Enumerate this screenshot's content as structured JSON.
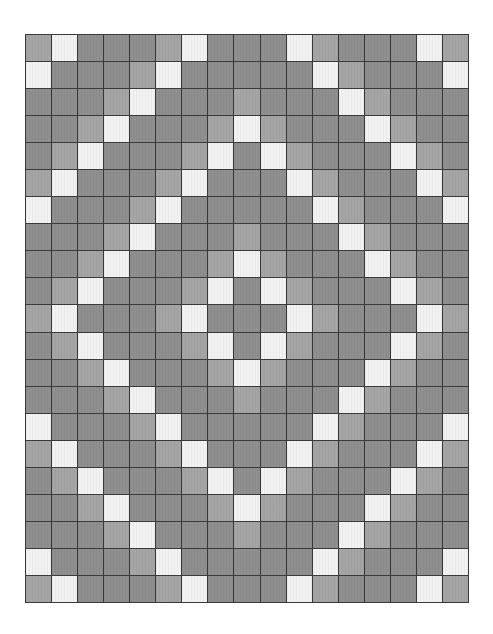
{
  "pattern": {
    "columns": 17,
    "rows": 21,
    "palette": {
      "W": "#f2f2f2",
      "L": "#a5a5a5",
      "M": "#8f8f8f"
    },
    "grid_line_color": "#3a3a3a",
    "cells": [
      "LWMMMLWMMMWLMMMWL",
      "WMMMLWMMMMMWLMMMW",
      "MMMLWMMMLMMMWLMMM",
      "MMLWMMMLWLMMMWLMM",
      "MLWMMMLWMWLMMMWLM",
      "LWMMMLWMMMWLMMMWL",
      "WMMMLWMMMMMWLMMMW",
      "MMMLWMMMLMMMWLMMM",
      "MMLWMMMLWLMMMWLMM",
      "MLWMMMLWMWLMMMWLM",
      "LWMMMLWMMMWLMMMWL",
      "MLWMMMLWMWLMMMWLM",
      "MMLWMMMLWLMMMWLMM",
      "MMMLWMMMLMMMWLMMM",
      "WMMMLWMMMMMWLMMMW",
      "LWMMMLWMMMWLMMMWL",
      "MLWMMMLWMWLMMMWLM",
      "MMLWMMMLWLMMMWLMM",
      "MMMLWMMMLMMMWLMMM",
      "WMMMLWMMMMMWLMMMW",
      "LWMMMLWMMMWLMMMWL"
    ]
  }
}
